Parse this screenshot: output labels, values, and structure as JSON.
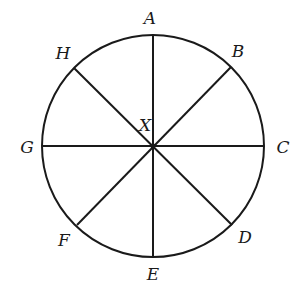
{
  "diagram": {
    "center": {
      "label": "X",
      "x": 153,
      "y": 146,
      "label_x": 145,
      "label_y": 131
    },
    "radius": 111,
    "stroke_color": "#1a1a1a",
    "points": [
      {
        "label": "A",
        "x": 153,
        "y": 35,
        "label_x": 150,
        "label_y": 24
      },
      {
        "label": "B",
        "x": 231,
        "y": 67,
        "label_x": 238,
        "label_y": 57
      },
      {
        "label": "C",
        "x": 264,
        "y": 146,
        "label_x": 283,
        "label_y": 153
      },
      {
        "label": "D",
        "x": 232,
        "y": 225,
        "label_x": 245,
        "label_y": 243
      },
      {
        "label": "E",
        "x": 153,
        "y": 257,
        "label_x": 153,
        "label_y": 280
      },
      {
        "label": "F",
        "x": 77,
        "y": 225,
        "label_x": 64,
        "label_y": 246
      },
      {
        "label": "G",
        "x": 42,
        "y": 146,
        "label_x": 27,
        "label_y": 153
      },
      {
        "label": "H",
        "x": 74,
        "y": 68,
        "label_x": 63,
        "label_y": 59
      }
    ],
    "diameters": [
      [
        "A",
        "E"
      ],
      [
        "B",
        "F"
      ],
      [
        "C",
        "G"
      ],
      [
        "D",
        "H"
      ]
    ]
  }
}
